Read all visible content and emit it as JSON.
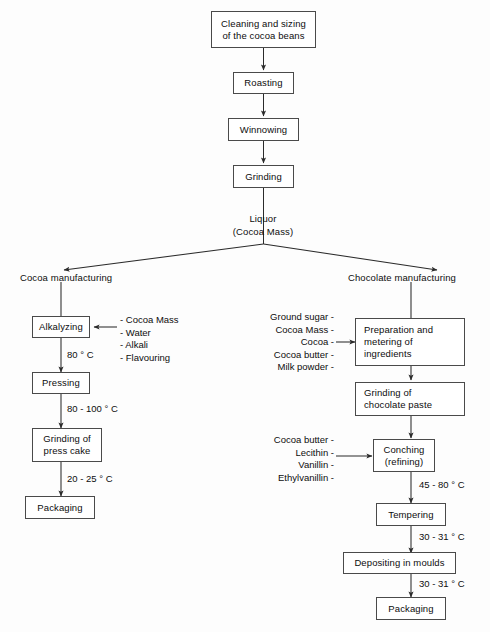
{
  "diagram": {
    "line_color": "#4a4a4a",
    "text_color": "#0d0d0d",
    "background": "#fdfdfd"
  },
  "common_stages": {
    "cleaning": "Cleaning and sizing\nof the cocoa beans",
    "roasting": "Roasting",
    "winnowing": "Winnowing",
    "grinding": "Grinding"
  },
  "split": {
    "liquor_label": "Liquor\n(Cocoa Mass)",
    "left_branch_label": "Cocoa manufacturing",
    "right_branch_label": "Chocolate manufacturing"
  },
  "cocoa_line": {
    "alkalyzing": "Alkalyzing",
    "pressing": "Pressing",
    "grinding_press_cake": "Grinding of\npress cake",
    "packaging": "Packaging",
    "additives": "- Cocoa Mass\n- Water\n- Alkali\n- Flavouring",
    "temp_alkalyzing_to_pressing": "80 ° C",
    "temp_pressing_to_grinding": "80 - 100 ° C",
    "temp_grinding_to_packaging": "20 - 25 ° C"
  },
  "chocolate_line": {
    "preparation": "Preparation and\nmetering of\ningredients",
    "grinding_paste": "Grinding of\nchocolate paste",
    "conching": "Conching\n(refining)",
    "tempering": "Tempering",
    "depositing": "Depositing in moulds",
    "packaging": "Packaging",
    "preparation_ingredients": "Ground sugar -\nCocoa Mass -\nCocoa -\nCocoa butter -\nMilk powder -",
    "conching_ingredients": "Cocoa butter -\nLecithin -\nVanillin -\nEthylvanillin -",
    "temp_conching_to_tempering": "45 - 80 ° C",
    "temp_tempering_to_depositing": "30 - 31 ° C",
    "temp_depositing_to_packaging": "30 - 31 ° C"
  }
}
